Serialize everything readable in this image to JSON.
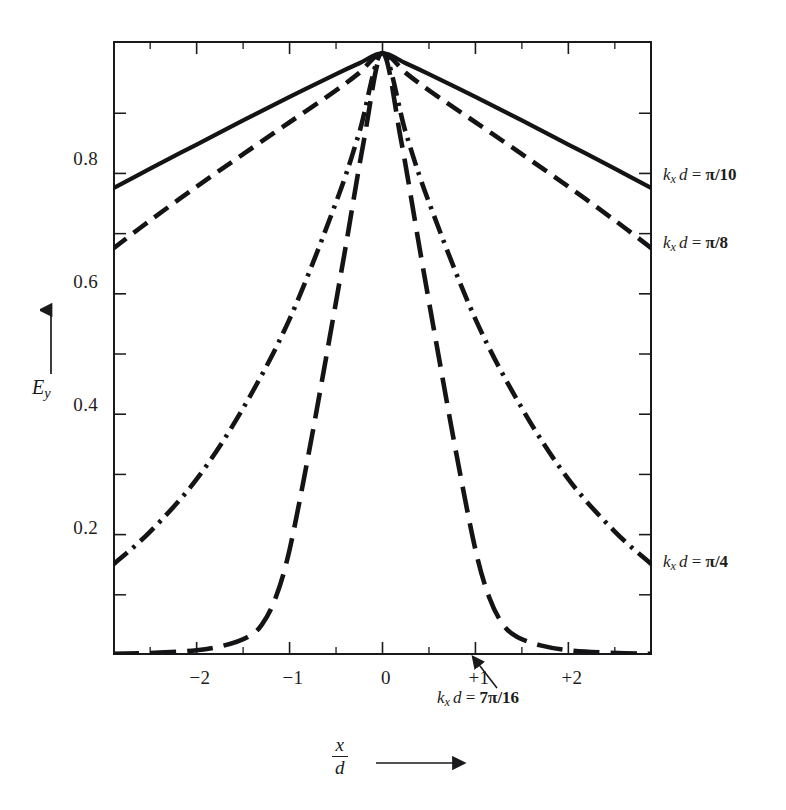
{
  "figure": {
    "background_color": "#ffffff",
    "ink_color": "#1a1a1c"
  },
  "axes": {
    "y_title": "E",
    "y_title_sub": "y",
    "y_title_arrow": "up-arrow",
    "x_title_num": "x",
    "x_title_den": "d",
    "x_title_arrow": "right-arrow",
    "y_ticklabels": [
      "0.8",
      "0.6",
      "0.4",
      "0.2"
    ],
    "x_ticklabels": [
      "−2",
      "−1",
      "0",
      "+1",
      "+2"
    ]
  },
  "series_labels": [
    {
      "name": "pi-over-10",
      "k": "k",
      "sub": "x",
      "d": "d",
      "eq": " = ",
      "value": "π/10"
    },
    {
      "name": "pi-over-8",
      "k": "k",
      "sub": "x",
      "d": "d",
      "eq": " = ",
      "value": "π/8"
    },
    {
      "name": "pi-over-4",
      "k": "k",
      "sub": "x",
      "d": "d",
      "eq": " = ",
      "value": "π/4"
    }
  ],
  "callout": {
    "name": "7pi-over-16",
    "k": "k",
    "sub": "x",
    "d": "d",
    "eq": " = ",
    "value": "7π/16"
  },
  "chart_data": {
    "type": "line",
    "title": "",
    "xlabel": "x/d",
    "ylabel": "E_y",
    "xlim": [
      -2.9,
      2.9
    ],
    "ylim": [
      0.0,
      1.02
    ],
    "grid": false,
    "legend": "right-of-axes (inline curve end labels)",
    "x_ticks": [
      -2,
      -1,
      0,
      1,
      2
    ],
    "y_ticks": [
      0.2,
      0.4,
      0.6,
      0.8
    ],
    "y_minor_ticks": [
      0.1,
      0.3,
      0.5,
      0.7,
      0.9
    ],
    "x_minor_ticks": [
      -2.5,
      -1.5,
      -0.5,
      0.5,
      1.5,
      2.5
    ],
    "series": [
      {
        "name": "k_x d = π/10",
        "linestyle": "solid",
        "x": [
          -2.9,
          -2.5,
          -2.0,
          -1.5,
          -1.0,
          -0.5,
          -0.25,
          0.0,
          0.25,
          0.5,
          1.0,
          1.5,
          2.0,
          2.5,
          2.9
        ],
        "values": [
          0.775,
          0.808,
          0.848,
          0.888,
          0.927,
          0.965,
          0.983,
          1.0,
          0.983,
          0.965,
          0.927,
          0.888,
          0.848,
          0.808,
          0.775
        ]
      },
      {
        "name": "k_x d = π/8",
        "linestyle": "dashed",
        "x": [
          -2.9,
          -2.5,
          -2.0,
          -1.5,
          -1.0,
          -0.5,
          -0.25,
          0.0,
          0.25,
          0.5,
          1.0,
          1.5,
          2.0,
          2.5,
          2.9
        ],
        "values": [
          0.675,
          0.722,
          0.778,
          0.832,
          0.885,
          0.938,
          0.967,
          1.0,
          0.967,
          0.938,
          0.885,
          0.832,
          0.778,
          0.722,
          0.675
        ]
      },
      {
        "name": "k_x d = π/4",
        "linestyle": "dash-dot",
        "x": [
          -2.9,
          -2.5,
          -2.0,
          -1.5,
          -1.0,
          -0.5,
          -0.25,
          0.0,
          0.25,
          0.5,
          1.0,
          1.5,
          2.0,
          2.5,
          2.9
        ],
        "values": [
          0.15,
          0.205,
          0.292,
          0.41,
          0.558,
          0.752,
          0.868,
          1.0,
          0.868,
          0.752,
          0.558,
          0.41,
          0.292,
          0.205,
          0.15
        ]
      },
      {
        "name": "k_x d = 7π/16",
        "linestyle": "long-dashed",
        "x": [
          -2.9,
          -2.4,
          -2.0,
          -1.7,
          -1.45,
          -1.3,
          -1.15,
          -1.0,
          -0.8,
          -0.6,
          -0.4,
          -0.2,
          0.0,
          0.2,
          0.4,
          0.6,
          0.8,
          1.0,
          1.15,
          1.3,
          1.45,
          1.7,
          2.0,
          2.4,
          2.9
        ],
        "values": [
          0.002,
          0.004,
          0.008,
          0.016,
          0.03,
          0.05,
          0.095,
          0.175,
          0.33,
          0.5,
          0.675,
          0.855,
          1.0,
          0.855,
          0.675,
          0.5,
          0.33,
          0.175,
          0.095,
          0.05,
          0.03,
          0.016,
          0.008,
          0.004,
          0.002
        ]
      }
    ]
  }
}
